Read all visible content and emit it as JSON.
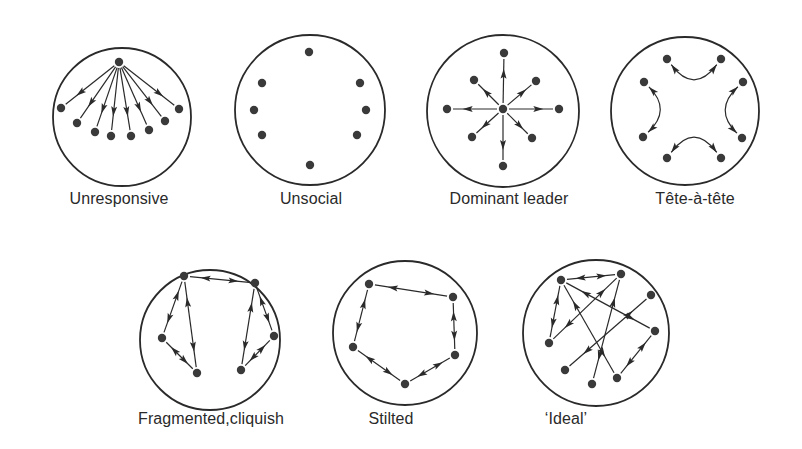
{
  "colors": {
    "ink": "#2a2a2a",
    "node": "#3a3a3a",
    "background": "#ffffff"
  },
  "diagrams": [
    {
      "id": "unresponsive",
      "label": "Unresponsive",
      "label_pos": [
        119,
        207
      ],
      "circle": {
        "cx": 122,
        "cy": 117,
        "r": 69
      },
      "nodes": [
        [
          119,
          62
        ],
        [
          61,
          108
        ],
        [
          77,
          123
        ],
        [
          95,
          132
        ],
        [
          111,
          136
        ],
        [
          131,
          136
        ],
        [
          149,
          130
        ],
        [
          165,
          121
        ],
        [
          179,
          109
        ]
      ],
      "edges": [
        [
          0,
          1,
          "one"
        ],
        [
          0,
          2,
          "one"
        ],
        [
          0,
          3,
          "one"
        ],
        [
          0,
          4,
          "one"
        ],
        [
          0,
          5,
          "one"
        ],
        [
          0,
          6,
          "one"
        ],
        [
          0,
          7,
          "one"
        ],
        [
          0,
          8,
          "one"
        ]
      ]
    },
    {
      "id": "unsocial",
      "label": "Unsocial",
      "label_pos": [
        311,
        207
      ],
      "circle": {
        "cx": 310,
        "cy": 110,
        "r": 75
      },
      "nodes": [
        [
          309,
          52
        ],
        [
          262,
          83
        ],
        [
          254,
          110
        ],
        [
          262,
          135
        ],
        [
          360,
          83
        ],
        [
          366,
          110
        ],
        [
          357,
          135
        ],
        [
          310,
          165
        ]
      ],
      "edges": []
    },
    {
      "id": "dominant-leader",
      "label": "Dominant leader",
      "label_pos": [
        509,
        207
      ],
      "circle": {
        "cx": 503,
        "cy": 111,
        "r": 76
      },
      "nodes": [
        [
          503,
          109
        ],
        [
          504,
          53
        ],
        [
          474,
          80
        ],
        [
          536,
          81
        ],
        [
          447,
          109
        ],
        [
          559,
          109
        ],
        [
          472,
          137
        ],
        [
          532,
          138
        ],
        [
          503,
          166
        ]
      ],
      "edges": [
        [
          0,
          1,
          "one"
        ],
        [
          0,
          2,
          "one"
        ],
        [
          0,
          3,
          "one"
        ],
        [
          0,
          4,
          "one"
        ],
        [
          0,
          5,
          "one"
        ],
        [
          0,
          6,
          "one"
        ],
        [
          0,
          7,
          "one"
        ],
        [
          0,
          8,
          "one"
        ]
      ]
    },
    {
      "id": "tete-a-tete",
      "label": "Tête-à-tête",
      "label_pos": [
        695,
        207
      ],
      "circle": {
        "cx": 685,
        "cy": 111,
        "r": 74
      },
      "nodes": [
        [
          667,
          59
        ],
        [
          721,
          59
        ],
        [
          644,
          82
        ],
        [
          743,
          82
        ],
        [
          643,
          137
        ],
        [
          742,
          138
        ],
        [
          667,
          158
        ],
        [
          721,
          158
        ]
      ],
      "arcs": [
        {
          "from": 0,
          "to": 1,
          "ctrl": [
            694,
            95
          ]
        },
        {
          "from": 2,
          "to": 4,
          "ctrl": [
            672,
            110
          ]
        },
        {
          "from": 3,
          "to": 5,
          "ctrl": [
            713,
            110
          ]
        },
        {
          "from": 6,
          "to": 7,
          "ctrl": [
            694,
            122
          ]
        }
      ]
    },
    {
      "id": "fragmented-cliquish",
      "label": "Fragmented,cliquish",
      "label_pos": [
        211,
        427
      ],
      "circle": {
        "cx": 210,
        "cy": 340,
        "r": 70
      },
      "nodes": [
        [
          184,
          276
        ],
        [
          255,
          283
        ],
        [
          162,
          338
        ],
        [
          197,
          373
        ],
        [
          241,
          370
        ],
        [
          274,
          336
        ]
      ],
      "edges": [
        [
          0,
          1,
          "both"
        ],
        [
          0,
          2,
          "both"
        ],
        [
          0,
          3,
          "both"
        ],
        [
          2,
          3,
          "both"
        ],
        [
          1,
          4,
          "both"
        ],
        [
          1,
          5,
          "both"
        ],
        [
          4,
          5,
          "both"
        ]
      ]
    },
    {
      "id": "stilted",
      "label": "Stilted",
      "label_pos": [
        391,
        427
      ],
      "circle": {
        "cx": 405,
        "cy": 333,
        "r": 72
      },
      "nodes": [
        [
          369,
          284
        ],
        [
          453,
          297
        ],
        [
          353,
          347
        ],
        [
          405,
          384
        ],
        [
          455,
          355
        ]
      ],
      "edges": [
        [
          0,
          1,
          "both"
        ],
        [
          0,
          2,
          "both"
        ],
        [
          2,
          3,
          "both"
        ],
        [
          3,
          4,
          "both"
        ],
        [
          1,
          4,
          "both"
        ]
      ]
    },
    {
      "id": "ideal",
      "label": "‘Ideal’",
      "label_pos": [
        566,
        427
      ],
      "circle": {
        "cx": 596,
        "cy": 333,
        "r": 73
      },
      "nodes": [
        [
          561,
          280
        ],
        [
          621,
          274
        ],
        [
          651,
          295
        ],
        [
          655,
          331
        ],
        [
          549,
          343
        ],
        [
          565,
          370
        ],
        [
          592,
          384
        ],
        [
          617,
          378
        ]
      ],
      "edges": [
        [
          0,
          1,
          "both"
        ],
        [
          0,
          4,
          "both"
        ],
        [
          0,
          3,
          "both"
        ],
        [
          0,
          7,
          "both"
        ],
        [
          1,
          4,
          "both"
        ],
        [
          1,
          6,
          "both"
        ],
        [
          2,
          5,
          "both"
        ],
        [
          3,
          7,
          "both"
        ]
      ]
    }
  ]
}
